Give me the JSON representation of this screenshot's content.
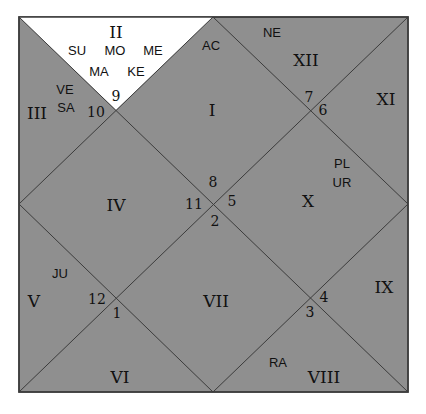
{
  "chart_title": "",
  "colors": {
    "background": "#ffffff",
    "house_fill": "#8f8f8f",
    "highlight_fill": "#ffffff",
    "line": "#3c3c3c",
    "text": "#111111"
  },
  "houses": [
    {
      "id": "I",
      "sign": 8,
      "planets": [
        "AC"
      ]
    },
    {
      "id": "II",
      "sign": 9,
      "planets": [
        "SU",
        "MO",
        "ME",
        "MA",
        "KE"
      ],
      "highlighted": true
    },
    {
      "id": "III",
      "sign": 10,
      "planets": [
        "VE",
        "SA"
      ]
    },
    {
      "id": "IV",
      "sign": 11,
      "planets": []
    },
    {
      "id": "V",
      "sign": 12,
      "planets": [
        "JU"
      ]
    },
    {
      "id": "VI",
      "sign": 1,
      "planets": []
    },
    {
      "id": "VII",
      "sign": 2,
      "planets": []
    },
    {
      "id": "VIII",
      "sign": 3,
      "planets": [
        "RA"
      ]
    },
    {
      "id": "IX",
      "sign": 4,
      "planets": []
    },
    {
      "id": "X",
      "sign": 5,
      "planets": [
        "PL",
        "UR"
      ]
    },
    {
      "id": "XI",
      "sign": 6,
      "planets": []
    },
    {
      "id": "XII",
      "sign": 7,
      "planets": [
        "NE"
      ]
    }
  ],
  "labels": {
    "roman": {
      "I": "I",
      "II": "II",
      "III": "III",
      "IV": "IV",
      "V": "V",
      "VI": "VI",
      "VII": "VII",
      "VIII": "VIII",
      "IX": "IX",
      "X": "X",
      "XI": "XI",
      "XII": "XII"
    },
    "signs": {
      "s1": "1",
      "s2": "2",
      "s3": "3",
      "s4": "4",
      "s5": "5",
      "s6": "6",
      "s7": "7",
      "s8": "8",
      "s9": "9",
      "s10": "10",
      "s11": "11",
      "s12": "12"
    },
    "planets": {
      "su": "SU",
      "mo": "MO",
      "me": "ME",
      "ma": "MA",
      "ke": "KE",
      "ve": "VE",
      "sa": "SA",
      "ac": "AC",
      "ne": "NE",
      "pl": "PL",
      "ur": "UR",
      "ju": "JU",
      "ra": "RA"
    }
  }
}
